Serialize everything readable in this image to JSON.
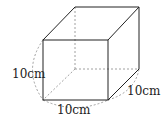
{
  "diagram": {
    "type": "cube",
    "labels": {
      "height": "10cm",
      "width": "10cm",
      "depth": "10cm"
    },
    "colors": {
      "edge": "#222222",
      "hidden": "#888888"
    }
  }
}
